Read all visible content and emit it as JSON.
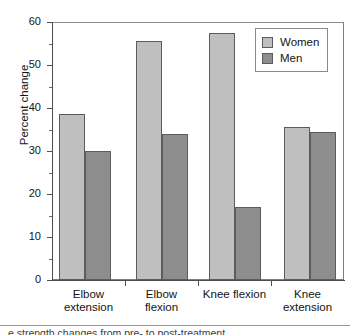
{
  "chart_data": {
    "type": "bar",
    "title": "",
    "xlabel": "",
    "ylabel": "Percent change",
    "ylim": [
      0,
      60
    ],
    "ytick_step": 10,
    "yminor_step": 5,
    "grid": false,
    "legend_position": "top-right",
    "categories": [
      "Elbow\nextension",
      "Elbow\nflexion",
      "Knee flexion",
      "Knee\nextension"
    ],
    "category_lines": [
      [
        "Elbow",
        "extension"
      ],
      [
        "Elbow",
        "flexion"
      ],
      [
        "Knee flexion"
      ],
      [
        "Knee",
        "extension"
      ]
    ],
    "ytick_labels": [
      "0",
      "10",
      "20",
      "30",
      "40",
      "50",
      "60"
    ],
    "ytick_values": [
      0,
      10,
      20,
      30,
      40,
      50,
      60
    ],
    "yminor_values": [
      5,
      15,
      25,
      35,
      45,
      55
    ],
    "series": [
      {
        "name": "Women",
        "color": "#bfbfbf",
        "values": [
          38.7,
          55.5,
          57.5,
          35.5
        ]
      },
      {
        "name": "Men",
        "color": "#8d8d8d",
        "values": [
          30.0,
          34.0,
          17.0,
          34.5
        ]
      }
    ]
  },
  "legend": {
    "items": [
      {
        "label": "Women",
        "swatch": "women"
      },
      {
        "label": "Men",
        "swatch": "men"
      }
    ]
  },
  "caption": {
    "clipped_text": "e strength changes from pre- to post-treatment"
  }
}
